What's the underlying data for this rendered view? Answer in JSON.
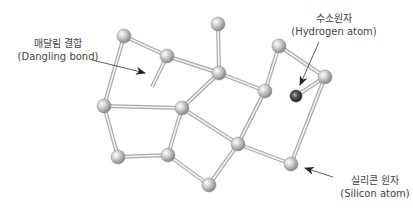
{
  "labels": {
    "dangling_bond": {
      "ko": "매달림 결합",
      "en": "(Dangling bond)"
    },
    "hydrogen_atom": {
      "ko": "수소원자",
      "en": "(Hydrogen atom)"
    },
    "silicon_atom": {
      "ko": "실리콘 원자",
      "en": "(Silicon atom)"
    }
  },
  "colors": {
    "silicon": "#b8b8b8",
    "hydrogen": "#4a4a4a",
    "bond": "#aaaaaa",
    "text": "#444444"
  },
  "atoms": [
    {
      "id": "A1",
      "type": "Si",
      "x": 124,
      "y": 36
    },
    {
      "id": "A2",
      "type": "Si",
      "x": 167,
      "y": 56
    },
    {
      "id": "A3",
      "type": "Si",
      "x": 218,
      "y": 24
    },
    {
      "id": "A4",
      "type": "Si",
      "x": 219,
      "y": 73
    },
    {
      "id": "A5",
      "type": "Si",
      "x": 265,
      "y": 91
    },
    {
      "id": "A6",
      "type": "Si",
      "x": 279,
      "y": 46
    },
    {
      "id": "A7",
      "type": "Si",
      "x": 325,
      "y": 77
    },
    {
      "id": "H",
      "type": "H",
      "x": 296,
      "y": 96
    },
    {
      "id": "A8",
      "type": "Si",
      "x": 104,
      "y": 106
    },
    {
      "id": "A9",
      "type": "Si",
      "x": 182,
      "y": 108
    },
    {
      "id": "A10",
      "type": "Si",
      "x": 238,
      "y": 144
    },
    {
      "id": "A11",
      "type": "Si",
      "x": 118,
      "y": 157
    },
    {
      "id": "A12",
      "type": "Si",
      "x": 168,
      "y": 155
    },
    {
      "id": "A13",
      "type": "Si",
      "x": 209,
      "y": 185
    },
    {
      "id": "A14",
      "type": "Si",
      "x": 291,
      "y": 164
    }
  ],
  "bonds": [
    [
      "A1",
      "A2"
    ],
    [
      "A1",
      "A8"
    ],
    [
      "A2",
      "A4"
    ],
    [
      "A3",
      "A4"
    ],
    [
      "A4",
      "A9"
    ],
    [
      "A4",
      "A5"
    ],
    [
      "A5",
      "A6"
    ],
    [
      "A6",
      "A7"
    ],
    [
      "A7",
      "H"
    ],
    [
      "A7",
      "A14"
    ],
    [
      "A5",
      "A10"
    ],
    [
      "A8",
      "A9"
    ],
    [
      "A8",
      "A11"
    ],
    [
      "A9",
      "A12"
    ],
    [
      "A9",
      "A10"
    ],
    [
      "A11",
      "A12"
    ],
    [
      "A12",
      "A13"
    ],
    [
      "A13",
      "A10"
    ],
    [
      "A10",
      "A14"
    ]
  ],
  "dangling": {
    "from": "A2",
    "x2": 152,
    "y2": 87
  }
}
